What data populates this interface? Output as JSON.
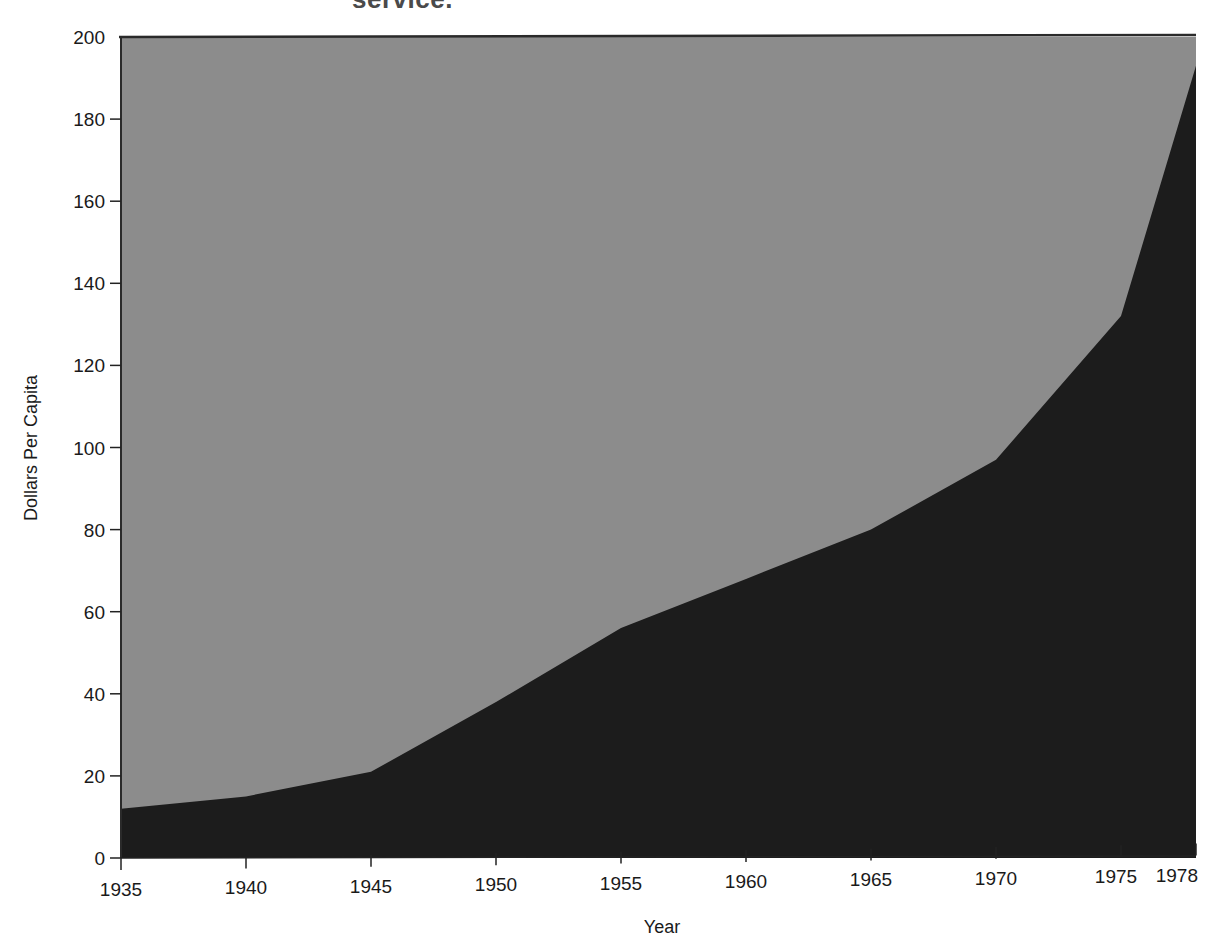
{
  "title_fragment": "service.",
  "chart_data": {
    "type": "area",
    "title": "service.",
    "xlabel": "Year",
    "ylabel": "Dollars Per Capita",
    "x": [
      1935,
      1940,
      1945,
      1950,
      1955,
      1960,
      1965,
      1970,
      1975,
      1978
    ],
    "series": [
      {
        "name": "Dollars Per Capita",
        "values": [
          12,
          15,
          21,
          38,
          56,
          68,
          80,
          97,
          132,
          193
        ],
        "color": "#1c1c1c"
      }
    ],
    "background_fill": "#8c8c8c",
    "xticks": [
      "1935",
      "1940",
      "1945",
      "1950",
      "1955",
      "1960",
      "1965",
      "1970",
      "1975",
      "1978"
    ],
    "yticks": [
      "0",
      "20",
      "40",
      "60",
      "80",
      "100",
      "120",
      "140",
      "160",
      "180",
      "200"
    ],
    "xlim": [
      1935,
      1978
    ],
    "ylim": [
      0,
      200
    ],
    "grid": false,
    "legend": null
  },
  "colors": {
    "upper_area": "#8c8c8c",
    "lower_area": "#1c1c1c",
    "frame": "#2a2a2a"
  }
}
